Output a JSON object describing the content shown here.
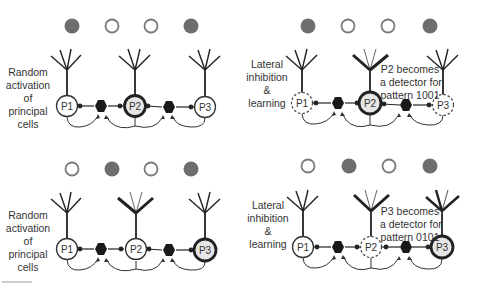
{
  "colors": {
    "filled_input": "#6e6e6e",
    "empty_input_stroke": "#7a7a7a",
    "line": "#222222",
    "active_cell_fill": "#e6e6e6",
    "interneuron": "#1a1a1a"
  },
  "panels": [
    {
      "id": "top-left",
      "side_label": [
        "Random",
        "activation",
        "of",
        "principal",
        "cells"
      ],
      "inputs": [
        1,
        0,
        0,
        1
      ],
      "cells": [
        {
          "name": "P1",
          "state": "normal"
        },
        {
          "name": "P2",
          "state": "active"
        },
        {
          "name": "P3",
          "state": "normal"
        }
      ],
      "note": []
    },
    {
      "id": "top-right",
      "side_label": [
        "Lateral",
        "inhibition",
        "&",
        "learning"
      ],
      "inputs": [
        1,
        0,
        0,
        1
      ],
      "cells": [
        {
          "name": "P1",
          "state": "inhibited"
        },
        {
          "name": "P2",
          "state": "active"
        },
        {
          "name": "P3",
          "state": "inhibited"
        }
      ],
      "note": [
        "P2 becomes",
        "a detector for",
        "pattern 1001"
      ]
    },
    {
      "id": "bottom-left",
      "side_label": [
        "Random",
        "activation",
        "of",
        "principal",
        "cells"
      ],
      "inputs": [
        0,
        1,
        0,
        1
      ],
      "cells": [
        {
          "name": "P1",
          "state": "normal"
        },
        {
          "name": "P2",
          "state": "normal"
        },
        {
          "name": "P3",
          "state": "active"
        }
      ],
      "note": []
    },
    {
      "id": "bottom-right",
      "side_label": [
        "Lateral",
        "inhibition",
        "&",
        "learning"
      ],
      "inputs": [
        0,
        1,
        0,
        1
      ],
      "cells": [
        {
          "name": "P1",
          "state": "normal"
        },
        {
          "name": "P2",
          "state": "inhibited"
        },
        {
          "name": "P3",
          "state": "active"
        }
      ],
      "note": [
        "P3 becomes",
        "a detector for",
        "pattern 0101"
      ]
    }
  ]
}
